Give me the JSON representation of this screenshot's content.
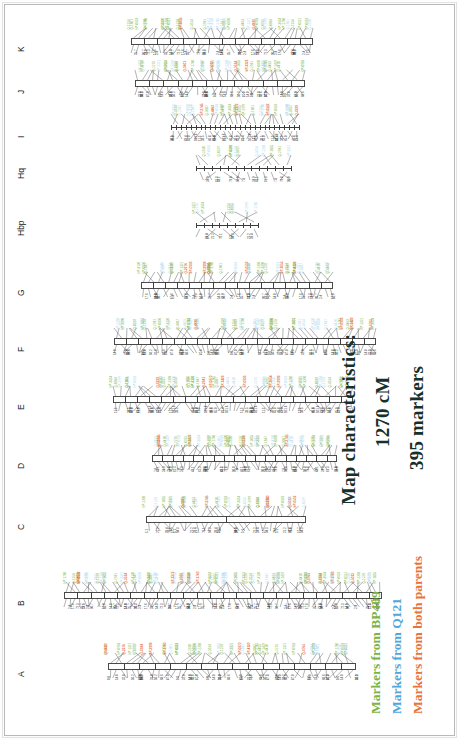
{
  "figure": {
    "type": "genetic-linkage-map",
    "orientation": "rotated-90-ccw",
    "background": "#ffffff",
    "frame_color": "#b9b9b9"
  },
  "characteristics": {
    "title": "Map characteristics:",
    "total_length": "1270 cM",
    "marker_count": "395 markers",
    "text_color": "#16302a"
  },
  "legend": {
    "items": [
      {
        "label": "Markers from BP409",
        "color": "#7cb342",
        "name": "legend-bp409"
      },
      {
        "label": "Markers from Q121",
        "color": "#4fa8dc",
        "name": "legend-q121"
      },
      {
        "label": "Markers from both parents",
        "color": "#e8743b",
        "name": "legend-both"
      }
    ]
  },
  "marker_colors": {
    "bp409": "#7cb342",
    "q121": "#a9d6ef",
    "both": "#e8743b"
  },
  "linkage_groups": [
    {
      "id": "A",
      "label": "A",
      "markers": 46,
      "length_px": 248,
      "ntick": 40,
      "nbox": 16
    },
    {
      "id": "B",
      "label": "B",
      "markers": 72,
      "length_px": 318,
      "ntick": 58,
      "nbox": 24
    },
    {
      "id": "C",
      "label": "C",
      "markers": 30,
      "length_px": 160,
      "ntick": 28,
      "nbox": 2
    },
    {
      "id": "D",
      "label": "D",
      "markers": 42,
      "length_px": 185,
      "ntick": 36,
      "nbox": 18
    },
    {
      "id": "E",
      "label": "E",
      "markers": 48,
      "length_px": 240,
      "ntick": 42,
      "nbox": 20
    },
    {
      "id": "F",
      "label": "F",
      "markers": 52,
      "length_px": 262,
      "ntick": 44,
      "nbox": 22
    },
    {
      "id": "G",
      "label": "G",
      "markers": 38,
      "length_px": 192,
      "ntick": 32,
      "nbox": 16
    },
    {
      "id": "Hbp",
      "label": "Hbp",
      "markers": 8,
      "length_px": 62,
      "ntick": 8,
      "nbox": 0
    },
    {
      "id": "Hq",
      "label": "Hq",
      "markers": 12,
      "length_px": 95,
      "ntick": 12,
      "nbox": 0
    },
    {
      "id": "I",
      "label": "I",
      "markers": 28,
      "length_px": 128,
      "ntick": 26,
      "nbox": 0
    },
    {
      "id": "J",
      "label": "J",
      "markers": 34,
      "length_px": 170,
      "ntick": 30,
      "nbox": 12
    },
    {
      "id": "K",
      "label": "K",
      "markers": 36,
      "length_px": 182,
      "ntick": 32,
      "nbox": 14
    }
  ],
  "marker_name_pool": [
    "bP-1429",
    "Q-2310",
    "bP-0870",
    "Q-1154",
    "bP-3321",
    "Q-0765",
    "bP-2208",
    "Q-4410",
    "bP-0512",
    "Q-3087",
    "bP-1760",
    "Q-2941",
    "bP-3654",
    "Q-1228",
    "bP-0933",
    "Q-5012",
    "bP-2745",
    "Q-1601",
    "bP-4120",
    "Q-0384",
    "bP-1055",
    "Q-2276",
    "bP-3390",
    "Q-4463",
    "bP-0618",
    "Q-1847",
    "bP-2999",
    "Q-3514",
    "bP-1372",
    "Q-0229"
  ],
  "position_pool": [
    "0.0",
    "2.4",
    "5.1",
    "7.8",
    "11.3",
    "14.0",
    "17.6",
    "21.2",
    "24.9",
    "28.5",
    "32.0",
    "35.7",
    "39.4",
    "43.1",
    "46.8",
    "50.2",
    "54.0",
    "57.7",
    "61.3",
    "65.0",
    "68.6",
    "72.3",
    "76.1",
    "79.8",
    "83.4",
    "87.0",
    "90.7",
    "94.3",
    "98.0",
    "101.6"
  ]
}
